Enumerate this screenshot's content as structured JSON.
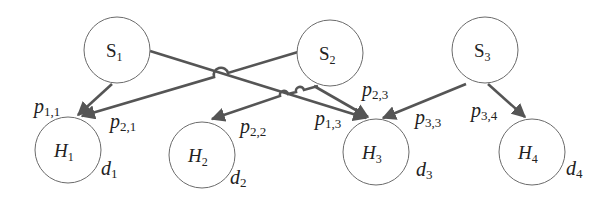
{
  "diagram": {
    "sources": [
      {
        "id": "S1",
        "label": "S",
        "sub": "1",
        "cx": 117,
        "cy": 50
      },
      {
        "id": "S2",
        "label": "S",
        "sub": "2",
        "cx": 330,
        "cy": 53
      },
      {
        "id": "S3",
        "label": "S",
        "sub": "3",
        "cx": 485,
        "cy": 50
      }
    ],
    "hosts": [
      {
        "id": "H1",
        "label": "H",
        "sub": "1",
        "cx": 68,
        "cy": 150,
        "demand": "d",
        "demand_sub": "1"
      },
      {
        "id": "H2",
        "label": "H",
        "sub": "2",
        "cx": 202,
        "cy": 155,
        "demand": "d",
        "demand_sub": "2"
      },
      {
        "id": "H3",
        "label": "H",
        "sub": "3",
        "cx": 376,
        "cy": 152,
        "demand": "d",
        "demand_sub": "3"
      },
      {
        "id": "H4",
        "label": "H",
        "sub": "4",
        "cx": 532,
        "cy": 152,
        "demand": "d",
        "demand_sub": "4"
      }
    ],
    "edges": [
      {
        "from": "S1",
        "to": "H1",
        "label": "p",
        "sub": "1,1"
      },
      {
        "from": "S2",
        "to": "H1",
        "label": "p",
        "sub": "2,1"
      },
      {
        "from": "S2",
        "to": "H2",
        "label": "p",
        "sub": "2,2"
      },
      {
        "from": "S1",
        "to": "H3",
        "label": "p",
        "sub": "1,3"
      },
      {
        "from": "S2",
        "to": "H3",
        "label": "p",
        "sub": "2,3"
      },
      {
        "from": "S3",
        "to": "H3",
        "label": "p",
        "sub": "3,3"
      },
      {
        "from": "S3",
        "to": "H4",
        "label": "p",
        "sub": "3,4"
      }
    ],
    "colors": {
      "edge": "#555555",
      "node_stroke": "#6b6b6b",
      "text": "#222222"
    }
  }
}
